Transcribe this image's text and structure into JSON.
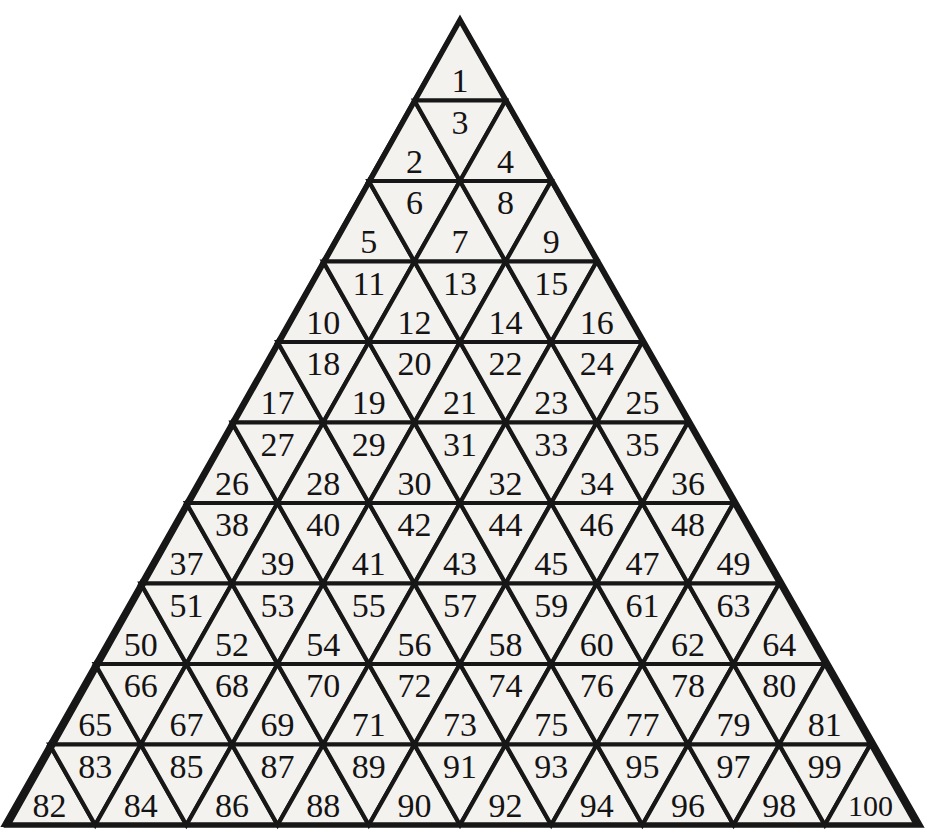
{
  "figure": {
    "name": "numbered-triangle-grid",
    "rows_count": 10,
    "cells_total": 100,
    "colors": {
      "page_background": "#ffffff",
      "cell_fill": "#f4f2ef",
      "outline": "#171717",
      "label_text": "#141414"
    },
    "geometry": {
      "apex_x": 460,
      "apex_y": 20,
      "base_left_x": 8,
      "base_right_x": 920,
      "base_y": 825,
      "row_height": 80.5
    }
  },
  "rows": [
    {
      "index": 1,
      "cell_count": 1,
      "labels": [
        "1"
      ]
    },
    {
      "index": 2,
      "cell_count": 3,
      "labels": [
        "2",
        "3",
        "4"
      ]
    },
    {
      "index": 3,
      "cell_count": 5,
      "labels": [
        "5",
        "6",
        "7",
        "8",
        "9"
      ]
    },
    {
      "index": 4,
      "cell_count": 7,
      "labels": [
        "10",
        "11",
        "12",
        "13",
        "14",
        "15",
        "16"
      ]
    },
    {
      "index": 5,
      "cell_count": 9,
      "labels": [
        "17",
        "18",
        "19",
        "20",
        "21",
        "22",
        "23",
        "24",
        "25"
      ]
    },
    {
      "index": 6,
      "cell_count": 11,
      "labels": [
        "26",
        "27",
        "28",
        "29",
        "30",
        "31",
        "32",
        "33",
        "34",
        "35",
        "36"
      ]
    },
    {
      "index": 7,
      "cell_count": 13,
      "labels": [
        "37",
        "38",
        "39",
        "40",
        "41",
        "42",
        "43",
        "44",
        "45",
        "46",
        "47",
        "48",
        "49"
      ]
    },
    {
      "index": 8,
      "cell_count": 15,
      "labels": [
        "50",
        "51",
        "52",
        "53",
        "54",
        "55",
        "56",
        "57",
        "58",
        "59",
        "60",
        "61",
        "62",
        "63",
        "64"
      ]
    },
    {
      "index": 9,
      "cell_count": 17,
      "labels": [
        "65",
        "66",
        "67",
        "68",
        "69",
        "70",
        "71",
        "72",
        "73",
        "74",
        "75",
        "76",
        "77",
        "78",
        "79",
        "80",
        "81"
      ]
    },
    {
      "index": 10,
      "cell_count": 19,
      "labels": [
        "82",
        "83",
        "84",
        "85",
        "86",
        "87",
        "88",
        "89",
        "90",
        "91",
        "92",
        "93",
        "94",
        "95",
        "96",
        "97",
        "98",
        "99",
        "100"
      ]
    }
  ]
}
